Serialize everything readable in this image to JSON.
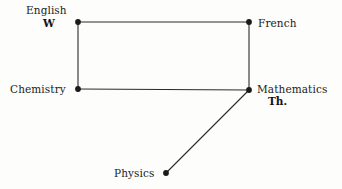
{
  "diagram": {
    "background_color": "#fdfdfc",
    "edge_color": "#2b2b2b",
    "node_color": "#1a1a1a",
    "nodes": [
      {
        "id": "english",
        "label": "English",
        "sub_label": "W",
        "x": 78,
        "y": 22
      },
      {
        "id": "french",
        "label": "French",
        "sub_label": "",
        "x": 249,
        "y": 22
      },
      {
        "id": "chemistry",
        "label": "Chemistry",
        "sub_label": "",
        "x": 78,
        "y": 89
      },
      {
        "id": "mathematics",
        "label": "Mathematics",
        "sub_label": "Th.",
        "x": 249,
        "y": 90
      },
      {
        "id": "physics",
        "label": "Physics",
        "sub_label": "",
        "x": 166,
        "y": 173
      }
    ],
    "edges": [
      {
        "from": "english",
        "to": "french"
      },
      {
        "from": "french",
        "to": "mathematics"
      },
      {
        "from": "mathematics",
        "to": "chemistry"
      },
      {
        "from": "chemistry",
        "to": "english"
      },
      {
        "from": "mathematics",
        "to": "physics"
      }
    ]
  }
}
